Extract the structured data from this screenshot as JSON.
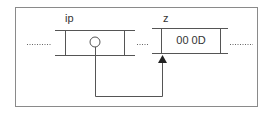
{
  "diagram": {
    "type": "memory-pointer",
    "cells": [
      {
        "name": "ip",
        "value": "",
        "content": "pointer-circle"
      },
      {
        "name": "z",
        "value": "00 0D"
      }
    ],
    "connections": [
      {
        "from": "ip",
        "to": "z",
        "style": "arrow"
      }
    ],
    "ellipsis": "........",
    "colors": {
      "line": "#555555",
      "text": "#333333",
      "frame": "#888888"
    }
  }
}
